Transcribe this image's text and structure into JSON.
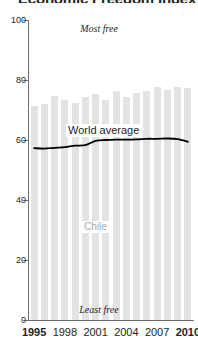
{
  "title": "Economic Freedom Index",
  "chart_data": {
    "type": "bar",
    "title": "Economic Freedom Index",
    "xlabel": "",
    "ylabel": "",
    "ylim": [
      0,
      100
    ],
    "yticks": [
      0,
      20,
      40,
      60,
      80,
      100
    ],
    "grid": false,
    "legend": "none",
    "x": [
      1995,
      1996,
      1997,
      1998,
      1999,
      2000,
      2001,
      2002,
      2003,
      2004,
      2005,
      2006,
      2007,
      2008,
      2009,
      2010
    ],
    "xtick_labels": [
      "1995",
      "1998",
      "2001",
      "2004",
      "2007",
      "2010"
    ],
    "xtick_values": [
      1995,
      1998,
      2001,
      2004,
      2007,
      2010
    ],
    "series": [
      {
        "name": "Chile",
        "type": "bar",
        "color": "#e3e3e4",
        "values": [
          71.2,
          72.0,
          74.6,
          73.4,
          72.5,
          74.3,
          75.2,
          73.4,
          76.5,
          74.5,
          75.8,
          76.2,
          77.8,
          76.6,
          77.8,
          77.2
        ]
      },
      {
        "name": "World average",
        "type": "line",
        "color": "#000000",
        "values": [
          57.3,
          57.1,
          57.4,
          57.6,
          58.1,
          58.3,
          59.7,
          60.0,
          60.1,
          60.1,
          60.2,
          60.4,
          60.4,
          60.5,
          60.3,
          59.4
        ]
      }
    ],
    "annotations": [
      {
        "text": "Most free",
        "position": "top-center"
      },
      {
        "text": "Least free",
        "position": "bottom-center"
      },
      {
        "text": "World average",
        "position": "on-line"
      },
      {
        "text": "Chile",
        "position": "in-bars"
      }
    ]
  },
  "axes": {
    "y_labels": [
      "100",
      "80",
      "60",
      "40",
      "20",
      "0"
    ],
    "x_labels": [
      "1995",
      "1998",
      "2001",
      "2004",
      "2007",
      "2010"
    ]
  },
  "labels": {
    "most_free": "Most free",
    "least_free": "Least free",
    "world_average": "World average",
    "chile": "Chile"
  },
  "colors": {
    "bar": "#e3e3e4",
    "line": "#000000",
    "axis": "#6d6e71",
    "chile_label": "#a7a9ac",
    "text": "#231f20"
  }
}
